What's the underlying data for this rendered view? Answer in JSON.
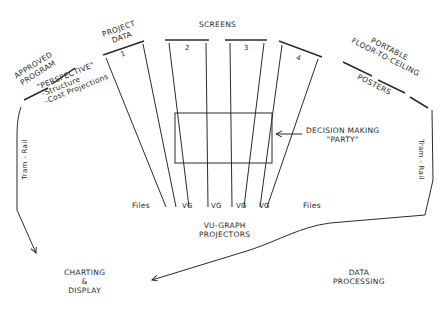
{
  "diagram": {
    "stroke_color": "#2a2a2a",
    "background": "#ffffff",
    "labels": {
      "approved_program": [
        "APPROVED",
        "PROGRAM"
      ],
      "perspective": [
        "\"PERSPECTIVE\"",
        "-Structure",
        "-Cost Projections"
      ],
      "project_data": [
        "PROJECT",
        "DATA"
      ],
      "screens_title": "SCREENS",
      "screen_numbers": [
        "1",
        "2",
        "3",
        "4"
      ],
      "portable_posters": [
        "PORTABLE",
        "FLOOR-TO-CEILING"
      ],
      "posters": "POSTERS",
      "decision_making": [
        "DECISION MAKING",
        "\"PARTY\""
      ],
      "files_left": "Files",
      "files_right": "Files",
      "vg_labels": [
        "VG",
        "VG",
        "VG",
        "VG"
      ],
      "vu_graph": [
        "VU-GRAPH",
        "PROJECTORS"
      ],
      "tram_rail_left": "Tram - Rail",
      "tram_rail_right": "Tram - Rail",
      "charting_display": [
        "CHARTING",
        "&",
        "DISPLAY"
      ],
      "data_processing": [
        "DATA",
        "PROCESSING"
      ]
    }
  }
}
